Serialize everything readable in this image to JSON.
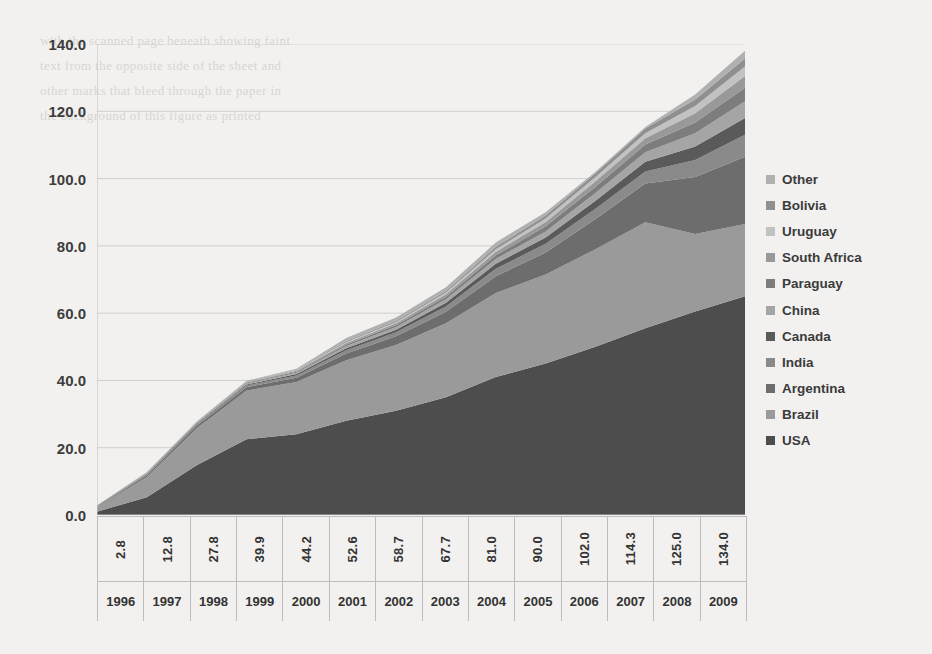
{
  "chart_data": {
    "type": "area",
    "stacked": true,
    "title": "",
    "xlabel": "",
    "ylabel": "",
    "ylim": [
      0,
      140
    ],
    "ytick_step": 20,
    "ytick_labels": [
      "0.0",
      "20.0",
      "40.0",
      "60.0",
      "80.0",
      "100.0",
      "120.0",
      "140.0"
    ],
    "grid": true,
    "legend_position": "right",
    "categories": [
      "1996",
      "1997",
      "1998",
      "1999",
      "2000",
      "2001",
      "2002",
      "2003",
      "2004",
      "2005",
      "2006",
      "2007",
      "2008",
      "2009"
    ],
    "totals": [
      2.8,
      12.8,
      27.8,
      39.9,
      44.2,
      52.6,
      58.7,
      67.7,
      81.0,
      90.0,
      102.0,
      114.3,
      125.0,
      134.0
    ],
    "total_labels": [
      "2.8",
      "12.8",
      "27.8",
      "39.9",
      "44.2",
      "52.6",
      "58.7",
      "67.7",
      "81.0",
      "90.0",
      "102.0",
      "114.3",
      "125.0",
      "134.0"
    ],
    "series": [
      {
        "name": "USA",
        "color": "#4d4d4d",
        "values": [
          1.0,
          5.3,
          14.8,
          22.5,
          24.0,
          28.0,
          31.0,
          35.0,
          41.0,
          45.0,
          50.0,
          55.5,
          60.5,
          65.0
        ]
      },
      {
        "name": "Brazil",
        "color": "#9a9a9a",
        "values": [
          1.4,
          6.0,
          11.0,
          14.5,
          15.5,
          18.0,
          19.5,
          22.0,
          25.0,
          26.5,
          29.0,
          31.5,
          23.0,
          21.5
        ]
      },
      {
        "name": "Argentina",
        "color": "#6d6d6d",
        "values": [
          0.1,
          0.5,
          0.7,
          1.0,
          1.3,
          2.0,
          2.6,
          3.4,
          5.0,
          6.5,
          9.0,
          11.5,
          17.0,
          20.0
        ]
      },
      {
        "name": "India",
        "color": "#8a8a8a",
        "values": [
          0.1,
          0.3,
          0.4,
          0.5,
          0.7,
          1.0,
          1.2,
          1.6,
          2.2,
          2.6,
          3.0,
          3.6,
          5.0,
          6.5
        ]
      },
      {
        "name": "Canada",
        "color": "#5a5a5a",
        "values": [
          0.05,
          0.15,
          0.2,
          0.3,
          0.4,
          0.6,
          0.8,
          1.1,
          1.5,
          1.9,
          2.4,
          2.9,
          4.0,
          5.0
        ]
      },
      {
        "name": "China",
        "color": "#a5a5a5",
        "values": [
          0.05,
          0.15,
          0.2,
          0.3,
          0.4,
          0.6,
          0.8,
          1.0,
          1.4,
          1.8,
          2.3,
          2.8,
          4.0,
          5.0
        ]
      },
      {
        "name": "Paraguay",
        "color": "#7d7d7d",
        "values": [
          0.03,
          0.1,
          0.15,
          0.2,
          0.3,
          0.5,
          0.6,
          0.8,
          1.1,
          1.5,
          1.9,
          2.3,
          3.2,
          4.0
        ]
      },
      {
        "name": "South Africa",
        "color": "#999999",
        "values": [
          0.02,
          0.08,
          0.1,
          0.15,
          0.25,
          0.4,
          0.5,
          0.7,
          1.0,
          1.3,
          1.6,
          1.9,
          2.7,
          3.5
        ]
      },
      {
        "name": "Uruguay",
        "color": "#c2c2c2",
        "values": [
          0.02,
          0.06,
          0.08,
          0.1,
          0.2,
          0.3,
          0.4,
          0.5,
          0.8,
          1.0,
          1.3,
          1.5,
          2.2,
          2.8
        ]
      },
      {
        "name": "Bolivia",
        "color": "#8f8f8f",
        "values": [
          0.02,
          0.05,
          0.07,
          0.1,
          0.15,
          0.3,
          0.35,
          0.5,
          0.7,
          0.9,
          1.1,
          1.4,
          1.9,
          2.4
        ]
      },
      {
        "name": "Other",
        "color": "#b0b0b0",
        "values": [
          0.06,
          0.12,
          0.1,
          0.25,
          0.3,
          0.9,
          0.95,
          1.1,
          1.3,
          1.0,
          0.4,
          0.4,
          1.5,
          2.3
        ]
      }
    ],
    "legend_order": [
      "Other",
      "Bolivia",
      "Uruguay",
      "South Africa",
      "Paraguay",
      "China",
      "Canada",
      "India",
      "Argentina",
      "Brazil",
      "USA"
    ]
  },
  "style": {
    "grid_color": "#cfcfcf",
    "axis_color": "#bdbdbd",
    "text_color": "#3d3d3d",
    "page_bg": "#f2f1ef"
  },
  "bleed_text": "with the scanned page beneath showing faint\ntext from the opposite side of the sheet and\nother marks that bleed through the paper in\nthe background of this figure as printed"
}
